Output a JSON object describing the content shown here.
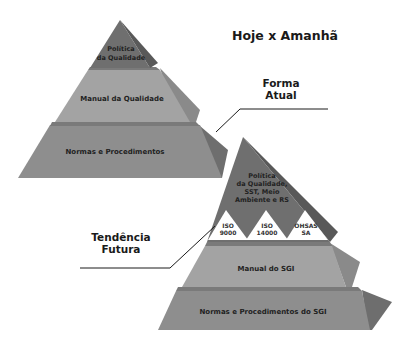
{
  "title": "Hoje x Amanhã",
  "colors": {
    "apex": "#6f6f6f",
    "apex_side": "#595959",
    "middle": "#a3a3a3",
    "middle_side": "#8a8a8a",
    "base": "#8e8e8e",
    "base_side": "#6e6e6e",
    "ledge": "#7a7a7a",
    "white_triangle": "#ffffff",
    "line": "#1a1a1a"
  },
  "current": {
    "callout_line1": "Forma",
    "callout_line2": "Atual",
    "tiers": [
      {
        "line1": "Política",
        "line2": "da Qualidade"
      },
      {
        "label": "Manual da Qualidade"
      },
      {
        "label": "Normas e Procedimentos"
      }
    ]
  },
  "future": {
    "callout_line1": "Tendência",
    "callout_line2": "Futura",
    "apex": {
      "line1": "Política",
      "line2": "da Qualidade,",
      "line3": "SST, Meio",
      "line4": "Ambiente e RS"
    },
    "standards": [
      {
        "line1": "ISO",
        "line2": "9000"
      },
      {
        "line1": "ISO",
        "line2": "14000"
      },
      {
        "line1": "OHSAS",
        "line2": "SA"
      }
    ],
    "tiers": [
      {
        "label": "Manual do SGI"
      },
      {
        "label": "Normas e Procedimentos do SGI"
      }
    ]
  }
}
